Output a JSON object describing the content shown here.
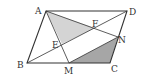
{
  "diagram": {
    "type": "geometry",
    "colors": {
      "stroke": "#333333",
      "shade_light": "#d4d4d4",
      "shade_dark": "#a6a6a6",
      "background": "#ffffff"
    },
    "points": {
      "A": {
        "label": "A",
        "x": 46,
        "y": 11
      },
      "B": {
        "label": "B",
        "x": 27,
        "y": 63
      },
      "C": {
        "label": "C",
        "x": 110,
        "y": 63
      },
      "D": {
        "label": "D",
        "x": 127,
        "y": 11
      },
      "E": {
        "label": "E",
        "x": 62,
        "y": 44
      },
      "F": {
        "label": "F",
        "x": 95,
        "y": 28
      },
      "M": {
        "label": "M",
        "x": 69,
        "y": 63
      },
      "N": {
        "label": "N",
        "x": 118,
        "y": 37
      }
    },
    "segments": [
      "AB",
      "BC",
      "CD",
      "DA",
      "BD",
      "AN",
      "AM",
      "MN"
    ],
    "shaded_regions": [
      {
        "name": "triangle-AEF",
        "vertices": [
          "A",
          "E",
          "F"
        ],
        "shade": "light"
      },
      {
        "name": "triangle-MCN",
        "vertices": [
          "M",
          "C",
          "N"
        ],
        "shade": "dark"
      }
    ]
  }
}
